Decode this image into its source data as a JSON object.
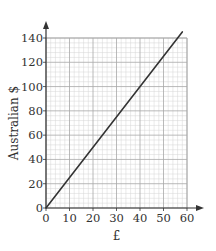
{
  "chart_data": {
    "type": "line",
    "title": "",
    "xlabel": "£",
    "ylabel": "Australian $",
    "xlim": [
      0,
      60
    ],
    "ylim": [
      0,
      140
    ],
    "x_ticks": [
      0,
      10,
      20,
      30,
      40,
      50,
      60
    ],
    "y_ticks": [
      0,
      20,
      40,
      60,
      80,
      100,
      120,
      140
    ],
    "x_minor_step": 2,
    "y_minor_step": 4,
    "grid": true,
    "legend": null,
    "series": [
      {
        "name": "Conversion £ to Australian $",
        "x": [
          0,
          58
        ],
        "y": [
          0,
          145
        ],
        "color": "#333333"
      }
    ]
  },
  "colors": {
    "axis": "#333333",
    "grid_major": "#a8a8a8",
    "grid_minor": "#d4d4d4",
    "line": "#333333"
  }
}
